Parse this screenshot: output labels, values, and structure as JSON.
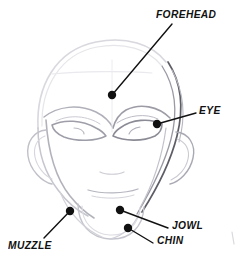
{
  "figure": {
    "medium": "pencil-sketch",
    "background_color": "#ffffff",
    "sketch_line_color": "#b9b9c2",
    "sketch_dark_line_color": "#4a4a52",
    "callout_color": "#111111",
    "width": 243,
    "height": 267
  },
  "callouts": [
    {
      "id": "forehead",
      "label": "FOREHEAD",
      "dot": {
        "x": 112,
        "y": 95
      },
      "leader_end": {
        "x": 172,
        "y": 24
      },
      "text_pos": {
        "x": 156,
        "y": 9
      }
    },
    {
      "id": "eye",
      "label": "EYE",
      "dot": {
        "x": 157,
        "y": 124
      },
      "leader_end": {
        "x": 196,
        "y": 113
      },
      "text_pos": {
        "x": 199,
        "y": 105
      }
    },
    {
      "id": "jowl",
      "label": "JOWL",
      "dot": {
        "x": 120,
        "y": 210
      },
      "leader_end": {
        "x": 168,
        "y": 228
      },
      "text_pos": {
        "x": 172,
        "y": 220
      }
    },
    {
      "id": "chin",
      "label": "CHIN",
      "dot": {
        "x": 128,
        "y": 228
      },
      "leader_end": {
        "x": 153,
        "y": 243
      },
      "text_pos": {
        "x": 157,
        "y": 235
      }
    },
    {
      "id": "muzzle",
      "label": "MUZZLE",
      "dot": {
        "x": 70,
        "y": 211
      },
      "leader_end": {
        "x": 44,
        "y": 238
      },
      "text_pos": {
        "x": 8,
        "y": 240
      }
    }
  ],
  "sketch_parts": [
    {
      "id": "cranium",
      "name": "cranium-outline"
    },
    {
      "id": "face-mass",
      "name": "face-mass-outline"
    },
    {
      "id": "jaw",
      "name": "jaw-line"
    },
    {
      "id": "chin-block",
      "name": "chin-block"
    },
    {
      "id": "brow-left",
      "name": "left-brow-ridge"
    },
    {
      "id": "brow-right",
      "name": "right-brow-ridge"
    },
    {
      "id": "eye-left",
      "name": "left-eye"
    },
    {
      "id": "eye-right",
      "name": "right-eye"
    },
    {
      "id": "ear-left",
      "name": "left-ear"
    },
    {
      "id": "ear-right",
      "name": "right-ear"
    },
    {
      "id": "nose",
      "name": "nose-line"
    },
    {
      "id": "mouth",
      "name": "mouth-line"
    },
    {
      "id": "centerline",
      "name": "face-centerline"
    },
    {
      "id": "browline",
      "name": "horizontal-brow-guide"
    },
    {
      "id": "edge-mark",
      "name": "page-edge-mark"
    }
  ]
}
